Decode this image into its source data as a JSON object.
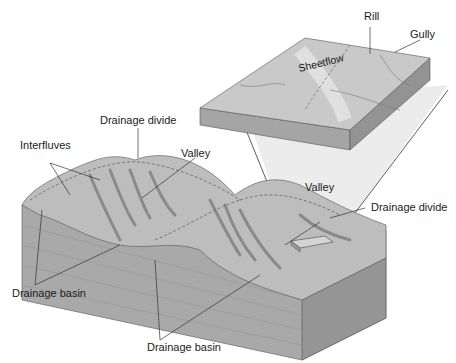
{
  "diagram": {
    "type": "drainage basin block diagram",
    "labels": {
      "rill": "Rill",
      "gully": "Gully",
      "sheetflow": "Sheetflow",
      "drainage_divide_top": "Drainage divide",
      "interfluves": "Interfluves",
      "valley_left": "Valley",
      "valley_right": "Valley",
      "drainage_divide_right": "Drainage divide",
      "drainage_basin_left": "Drainage basin",
      "drainage_basin_bottom": "Drainage basin"
    },
    "colors": {
      "surface": "#b9b9b9",
      "surface_light": "#d8d8d8",
      "side": "#a8a8a8",
      "side_dark": "#8f8f8f",
      "wedge": "#e9e9e9",
      "line": "#333333"
    }
  }
}
